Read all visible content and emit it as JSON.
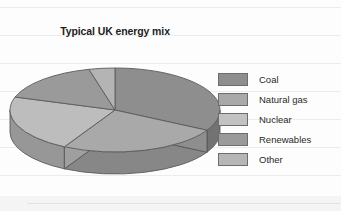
{
  "chart_data": {
    "type": "pie",
    "title": "Typical UK energy mix",
    "xlabel": "",
    "ylabel": "",
    "legend_position": "right",
    "grid": true,
    "three_d": true,
    "categories": [
      "Coal",
      "Natural gas",
      "Nuclear",
      "Renewables",
      "Other"
    ],
    "values": [
      33,
      25,
      22,
      16,
      4
    ],
    "slices": [
      {
        "label": "Coal",
        "value": 33,
        "color": "#8e8e8e"
      },
      {
        "label": "Natural gas",
        "value": 25,
        "color": "#a9a9a9"
      },
      {
        "label": "Nuclear",
        "value": 22,
        "color": "#bdbdbd"
      },
      {
        "label": "Renewables",
        "value": 16,
        "color": "#9a9a9a"
      },
      {
        "label": "Other",
        "value": 4,
        "color": "#b4b4b4"
      }
    ]
  },
  "chart": {
    "title": "Typical UK energy mix"
  },
  "legend": {
    "items": [
      {
        "label": "Coal",
        "color": "#8e8e8e"
      },
      {
        "label": "Natural gas",
        "color": "#a9a9a9"
      },
      {
        "label": "Nuclear",
        "color": "#c2c2c2"
      },
      {
        "label": "Renewables",
        "color": "#9a9a9a"
      },
      {
        "label": "Other",
        "color": "#b6b6b6"
      }
    ]
  }
}
